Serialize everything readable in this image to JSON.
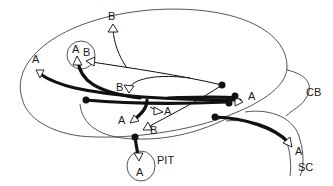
{
  "diagram": {
    "title": "",
    "regions": {
      "cb": "CB",
      "sc": "SC",
      "pit": "PIT"
    },
    "pathway_labels": {
      "a_left": "A",
      "a_circle": "A",
      "b_circle": "B",
      "b_top": "B",
      "b_mid": "B",
      "a_center_right": "A",
      "a_center_left": "A",
      "b_lower": "B",
      "a_right": "A",
      "a_sc": "A",
      "a_pit": "A"
    },
    "colors": {
      "stroke": "#111111",
      "background": "#ffffff"
    }
  }
}
